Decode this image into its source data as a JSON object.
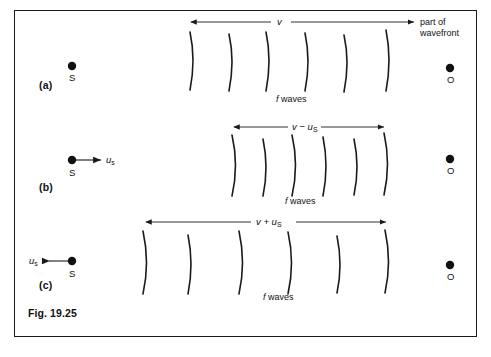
{
  "figure": {
    "caption": "Fig. 19.25",
    "frame_color": "#1a1a1a",
    "ink_color": "#111111",
    "background": "#ffffff",
    "width": 491,
    "height": 357
  },
  "annotations": {
    "part_of_wavefront_line1": "part of",
    "part_of_wavefront_line2": "wavefront"
  },
  "panels": [
    {
      "tag": "(a)",
      "source_label": "S",
      "observer_label": "O",
      "source_motion": "none",
      "source_speed_label": "",
      "arrow_label_main": "v",
      "arrow_label_sub": "",
      "arrow_label_full": "v",
      "waves_label_italic": "f",
      "waves_label_rest": "waves",
      "wavefront_count": 6,
      "arrow_span_px": [
        190,
        415
      ]
    },
    {
      "tag": "(b)",
      "source_label": "S",
      "observer_label": "O",
      "source_motion": "right",
      "source_speed_italic": "u",
      "source_speed_sub": "s",
      "arrow_label_main": "v − u",
      "arrow_label_sub": "S",
      "arrow_label_full": "v − uS",
      "waves_label_italic": "f",
      "waves_label_rest": "waves",
      "wavefront_count": 6,
      "arrow_span_px": [
        233,
        385
      ]
    },
    {
      "tag": "(c)",
      "source_label": "S",
      "observer_label": "O",
      "source_motion": "left",
      "source_speed_italic": "u",
      "source_speed_sub": "s",
      "arrow_label_main": "v + u",
      "arrow_label_sub": "S",
      "arrow_label_full": "v + uS",
      "waves_label_italic": "f",
      "waves_label_rest": "waves",
      "wavefront_count": 6,
      "arrow_span_px": [
        145,
        387
      ]
    }
  ]
}
